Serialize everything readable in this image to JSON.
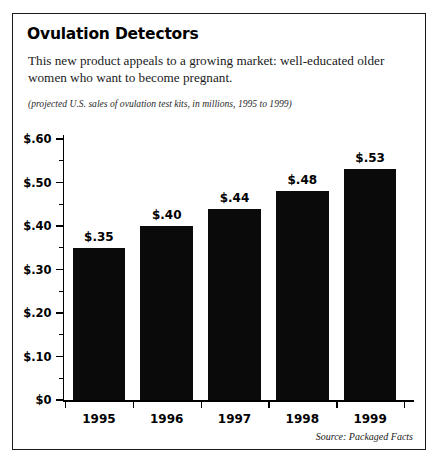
{
  "card": {
    "title": "Ovulation Detectors",
    "description": "This new product appeals to a growing market: well-educated older women who want to become pregnant.",
    "caption": "(projected U.S. sales of ovulation test kits, in millions, 1995 to 1999)",
    "source": "Source: Packaged Facts"
  },
  "chart_data": {
    "type": "bar",
    "title": "Ovulation Detectors",
    "subtitle": "(projected U.S. sales of ovulation test kits, in millions, 1995 to 1999)",
    "categories": [
      "1995",
      "1996",
      "1997",
      "1998",
      "1999"
    ],
    "values": [
      0.35,
      0.4,
      0.44,
      0.48,
      0.53
    ],
    "value_labels": [
      "$.35",
      "$.40",
      "$.44",
      "$.48",
      "$.53"
    ],
    "xlabel": "",
    "ylabel": "",
    "ylim": [
      0,
      0.6
    ],
    "ytick_values": [
      0,
      0.1,
      0.2,
      0.3,
      0.4,
      0.5,
      0.6
    ],
    "ytick_labels": [
      "$0",
      "$.10",
      "$.20",
      "$.30",
      "$.40",
      "$.50",
      "$.60"
    ],
    "yminor_step": 0.05,
    "grid": false,
    "legend": null,
    "bar_color": "#0a0a0a",
    "source": "Source: Packaged Facts"
  }
}
